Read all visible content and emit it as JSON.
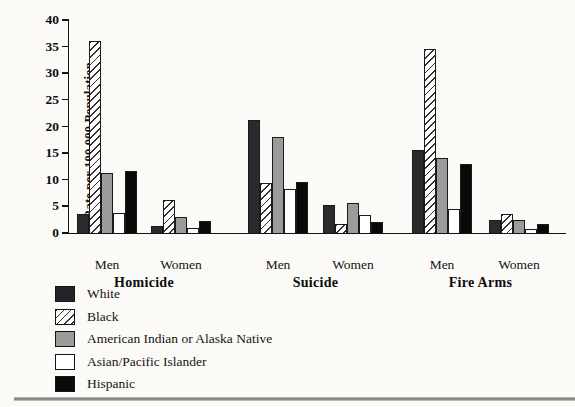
{
  "figure": {
    "background": "#fbfaf7",
    "bottom_rule_color": "#8a8a8a"
  },
  "chart": {
    "ylabel": "Rate per 100,000 Population",
    "yticks": [
      0,
      5,
      10,
      15,
      20,
      25,
      30,
      35,
      40
    ],
    "legend": [
      {
        "label": "White",
        "color": "#2a2a2f",
        "pattern": "solid"
      },
      {
        "label": "Black",
        "color": "#ffffff",
        "pattern": "diagonal-hatch"
      },
      {
        "label": "American Indian or Alaska Native",
        "color": "#9b9b9b",
        "pattern": "solid"
      },
      {
        "label": "Asian/Pacific Islander",
        "color": "#ffffff",
        "pattern": "solid"
      },
      {
        "label": "Hispanic",
        "color": "#090909",
        "pattern": "solid"
      }
    ]
  },
  "chart_data": {
    "type": "bar",
    "title": "",
    "xlabel": "",
    "ylabel": "Rate per 100,000 Population",
    "ylim": [
      0,
      40
    ],
    "grid": false,
    "legend_position": "bottom-left",
    "series_names": [
      "White",
      "Black",
      "American Indian or Alaska Native",
      "Asian/Pacific Islander",
      "Hispanic"
    ],
    "groups": [
      {
        "label": "Homicide",
        "clusters": [
          {
            "label": "Men",
            "values": [
              3.5,
              36.0,
              11.2,
              3.7,
              11.6
            ]
          },
          {
            "label": "Women",
            "values": [
              1.4,
              6.2,
              3.0,
              1.0,
              2.2
            ]
          }
        ]
      },
      {
        "label": "Suicide",
        "clusters": [
          {
            "label": "Men",
            "values": [
              21.2,
              9.3,
              18.0,
              8.2,
              9.5
            ]
          },
          {
            "label": "Women",
            "values": [
              5.3,
              1.7,
              5.6,
              3.4,
              2.1
            ]
          }
        ]
      },
      {
        "label": "Fire Arms",
        "clusters": [
          {
            "label": "Men",
            "values": [
              15.5,
              34.5,
              14.0,
              4.6,
              13.0
            ]
          },
          {
            "label": "Women",
            "values": [
              2.4,
              3.5,
              2.5,
              0.8,
              1.7
            ]
          }
        ]
      }
    ]
  }
}
